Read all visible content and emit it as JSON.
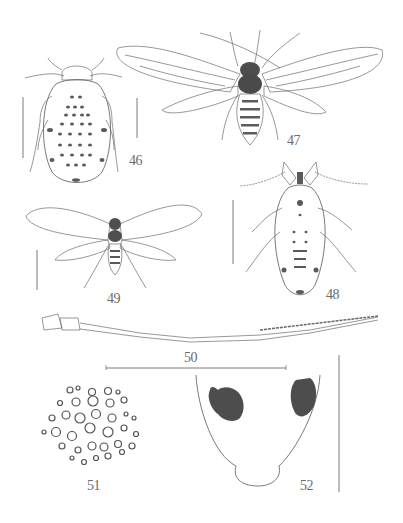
{
  "plate": {
    "background": "#ffffff",
    "ink_color": "#555555",
    "figures": [
      {
        "number": "46",
        "subject": "apterous aphid, dorsal view",
        "label": "46"
      },
      {
        "number": "47",
        "subject": "alate aphid, dorsal view with wings",
        "label": "47"
      },
      {
        "number": "48",
        "subject": "apterous aphid, dorsal view",
        "label": "48"
      },
      {
        "number": "49",
        "subject": "alate aphid, wings spread",
        "label": "49"
      },
      {
        "number": "50",
        "subject": "antenna",
        "label": "50"
      },
      {
        "number": "51",
        "subject": "secondary rhinaria / cuticle pattern",
        "label": "51"
      },
      {
        "number": "52",
        "subject": "cauda / posterior abdomen with dark patches",
        "label": "52"
      }
    ]
  }
}
